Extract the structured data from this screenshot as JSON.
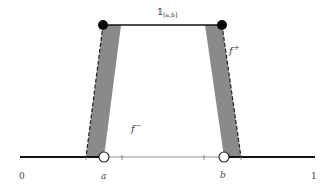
{
  "figure": {
    "colors": {
      "background": "#ffffff",
      "line": "#111111",
      "thin_line": "#555555",
      "shade": "#8a8a8a",
      "dash": "#222222",
      "dot": "#0a0a0a",
      "open_circle_fill": "#ffffff"
    },
    "axis": {
      "ticks": [
        {
          "label": "0",
          "x": 22
        },
        {
          "label": "a",
          "x": 104
        },
        {
          "label": "b",
          "x": 223
        },
        {
          "label": "1",
          "x": 313
        }
      ],
      "minor_ticks_x": [
        86,
        122,
        204,
        241
      ]
    },
    "labels": {
      "indicator_main": "𝟙",
      "indicator_sub": "[a,b]",
      "f_plus_main": "f",
      "f_plus_sup": "+",
      "f_minus_main": "f",
      "f_minus_sup": "−"
    },
    "points": {
      "filled": [
        {
          "name": "top-left-endpoint",
          "x": 103,
          "y": 25
        },
        {
          "name": "top-right-endpoint",
          "x": 222,
          "y": 25
        }
      ],
      "open": [
        {
          "name": "a-endpoint",
          "x": 104,
          "y": 157
        },
        {
          "name": "b-endpoint",
          "x": 224,
          "y": 157
        }
      ]
    }
  }
}
